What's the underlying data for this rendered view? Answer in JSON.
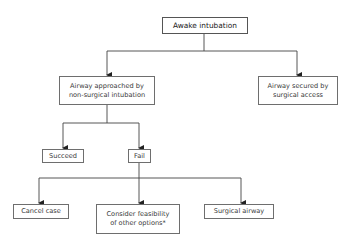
{
  "diagram": {
    "type": "flowchart",
    "nodes": {
      "root": {
        "label": "Awake intubation"
      },
      "non_surgical": {
        "label": "Airway approached by\nnon-surgical intubation"
      },
      "surgical_access": {
        "label": "Airway secured by\nsurgical access"
      },
      "succeed": {
        "label": "Succeed"
      },
      "fail": {
        "label": "Fail"
      },
      "cancel": {
        "label": "Cancel case"
      },
      "consider": {
        "label": "Consider feasibility\nof other options*"
      },
      "surgical_airway": {
        "label": "Surgical airway"
      }
    },
    "edges": [
      {
        "from": "root",
        "to": "non_surgical"
      },
      {
        "from": "root",
        "to": "surgical_access"
      },
      {
        "from": "non_surgical",
        "to": "succeed"
      },
      {
        "from": "non_surgical",
        "to": "fail"
      },
      {
        "from": "fail",
        "to": "cancel"
      },
      {
        "from": "fail",
        "to": "consider"
      },
      {
        "from": "fail",
        "to": "surgical_airway"
      }
    ],
    "colors": {
      "line": "#333333",
      "border": "#6e6e6e",
      "background": "#ffffff"
    }
  }
}
